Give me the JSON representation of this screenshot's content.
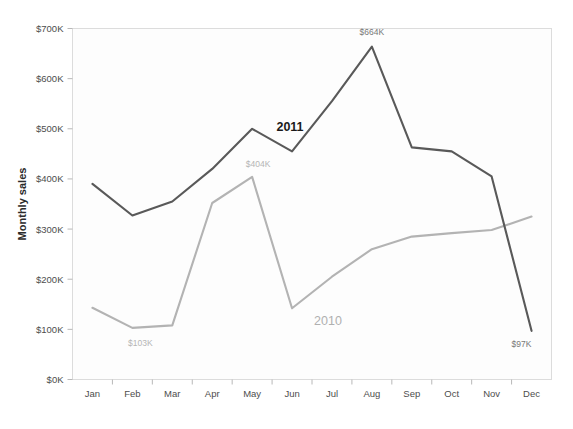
{
  "chart_data": {
    "type": "line",
    "title": "",
    "subtitle": "",
    "xlabel": "",
    "ylabel": "Monthly sales",
    "categories": [
      "Jan",
      "Feb",
      "Mar",
      "Apr",
      "May",
      "Jun",
      "Jul",
      "Aug",
      "Sep",
      "Oct",
      "Nov",
      "Dec"
    ],
    "ylim": [
      0,
      700
    ],
    "y_unit": "K",
    "y_prefix": "$",
    "ytick_labels": [
      "$0K",
      "$100K",
      "$200K",
      "$300K",
      "$400K",
      "$500K",
      "$600K",
      "$700K"
    ],
    "ytick_values": [
      0,
      100,
      200,
      300,
      400,
      500,
      600,
      700
    ],
    "grid": false,
    "legend_position": "inline",
    "series": [
      {
        "name": "2011",
        "color": "#595959",
        "values": [
          390,
          327,
          355,
          420,
          500,
          455,
          555,
          664,
          463,
          455,
          405,
          97
        ]
      },
      {
        "name": "2010",
        "color": "#b3b3b3",
        "values": [
          143,
          103,
          108,
          352,
          404,
          142,
          205,
          260,
          285,
          292,
          298,
          325
        ]
      }
    ],
    "annotations": [
      {
        "text": "$664K",
        "series": "2011",
        "category": "Aug",
        "value": 664,
        "style": "dark"
      },
      {
        "text": "$97K",
        "series": "2011",
        "category": "Dec",
        "value": 97,
        "style": "dark"
      },
      {
        "text": "$404K",
        "series": "2010",
        "category": "May",
        "value": 404,
        "style": "light"
      },
      {
        "text": "$103K",
        "series": "2010",
        "category": "Feb",
        "value": 103,
        "style": "light"
      }
    ],
    "series_labels": [
      {
        "text": "2011",
        "style": "dark"
      },
      {
        "text": "2010",
        "style": "light"
      }
    ]
  }
}
